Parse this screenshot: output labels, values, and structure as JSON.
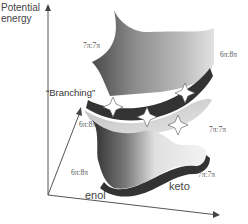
{
  "diagram": {
    "axes": {
      "y_label_line1": "Potential",
      "y_label_line2": "energy",
      "x_basin_left": "enol",
      "x_basin_right": "keto"
    },
    "annotation": {
      "branching_label": "“Branching”"
    },
    "state_labels": [
      {
        "text": "7π:7π",
        "region": "upper-left sheet"
      },
      {
        "text": "6π:8π",
        "region": "upper-right sheet"
      },
      {
        "text": "6π:8π",
        "region": "middle-left branch"
      },
      {
        "text": "7π:7π",
        "region": "middle-right branch"
      },
      {
        "text": "6π:8π",
        "region": "lower-left surface"
      },
      {
        "text": "7π:7π",
        "region": "lower-right surface"
      }
    ],
    "crossing_points_count": 4,
    "colors": {
      "axis": "#555555",
      "surface_dark": "#3a3a3a",
      "surface_mid": "#8a8a8a",
      "surface_light": "#e8e8e8",
      "star_fill": "#ffffff",
      "star_stroke": "#555555"
    }
  }
}
